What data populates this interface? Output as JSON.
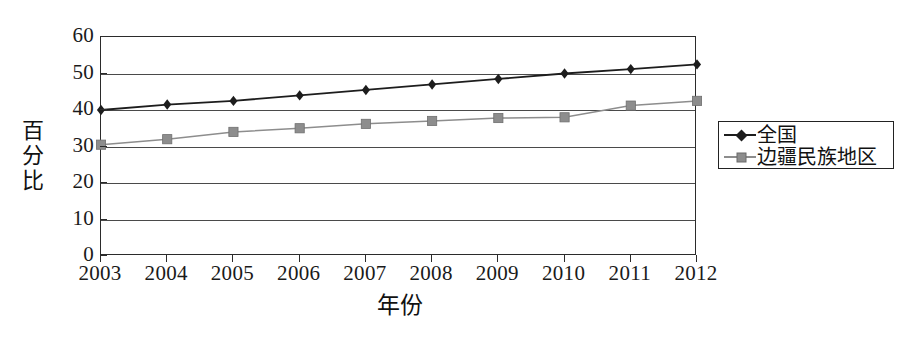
{
  "chart_data": {
    "type": "line",
    "title": "",
    "xlabel": "年份",
    "ylabel": "百分比",
    "ylabel_chars": [
      "百",
      "分",
      "比"
    ],
    "categories": [
      "2003",
      "2004",
      "2005",
      "2006",
      "2007",
      "2008",
      "2009",
      "2010",
      "2011",
      "2012"
    ],
    "ylim": [
      0,
      60
    ],
    "yticks": [
      0,
      10,
      20,
      30,
      40,
      50,
      60
    ],
    "ytick_labels": [
      "0",
      "10",
      "20",
      "30",
      "40",
      "50",
      "60"
    ],
    "grid": true,
    "grid_axis": "y",
    "legend_position": "right",
    "series": [
      {
        "name": "全国",
        "marker": "diamond",
        "color": "#1d1d1d",
        "values": [
          40.0,
          41.5,
          42.5,
          44.0,
          45.5,
          47.0,
          48.5,
          50.0,
          51.2,
          52.5
        ]
      },
      {
        "name": "边疆民族地区",
        "marker": "square",
        "color": "#8d8d8d",
        "values": [
          30.5,
          32.0,
          34.0,
          35.0,
          36.2,
          37.0,
          37.8,
          38.0,
          41.2,
          42.5
        ]
      }
    ]
  },
  "legend": {
    "entries": [
      {
        "label": "全国",
        "marker": "diamond-marker-icon"
      },
      {
        "label": "边疆民族地区",
        "marker": "square-marker-icon"
      }
    ]
  },
  "colors": {
    "national": "#1d1d1d",
    "border_region": "#8d8d8d",
    "axis": "#2b2b2b",
    "grid": "#4a4a4a",
    "background": "#ffffff"
  }
}
